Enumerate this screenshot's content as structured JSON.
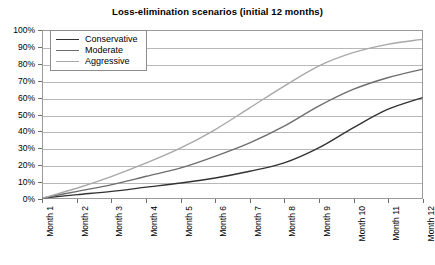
{
  "chart_data": {
    "type": "line",
    "title": "Loss-elimination scenarios (initial 12 months)",
    "xlabel": "",
    "ylabel": "",
    "grid": true,
    "legend_position": "top-left-inside",
    "ylim": [
      0,
      100
    ],
    "y_ticks": [
      0,
      10,
      20,
      30,
      40,
      50,
      60,
      70,
      80,
      90,
      100
    ],
    "y_tick_labels": [
      "0%",
      "10%",
      "20%",
      "30%",
      "40%",
      "50%",
      "60%",
      "70%",
      "80%",
      "90%",
      "100%"
    ],
    "categories": [
      "Month 1",
      "Month 2",
      "Month 3",
      "Month 4",
      "Month 5",
      "Month 6",
      "Month 7",
      "Month 8",
      "Month 9",
      "Month 10",
      "Month 11",
      "Month 12"
    ],
    "series": [
      {
        "name": "Conservative",
        "color": "#333333",
        "values": [
          0,
          2,
          4,
          6.5,
          9,
          12,
          16,
          21,
          30,
          42,
          53,
          60
        ]
      },
      {
        "name": "Moderate",
        "color": "#6e6e6e",
        "values": [
          0,
          4,
          8,
          13,
          18,
          25,
          33,
          43,
          55,
          65,
          72,
          77
        ]
      },
      {
        "name": "Aggressive",
        "color": "#a8a8a8",
        "values": [
          0,
          6,
          13,
          21,
          30,
          41,
          54,
          67,
          79,
          87,
          92,
          95
        ]
      }
    ]
  },
  "style": {
    "background": "#ffffff",
    "gridline_color": "#b8b8b8",
    "axis_color": "#9a9a9a",
    "text_color": "#000000"
  }
}
